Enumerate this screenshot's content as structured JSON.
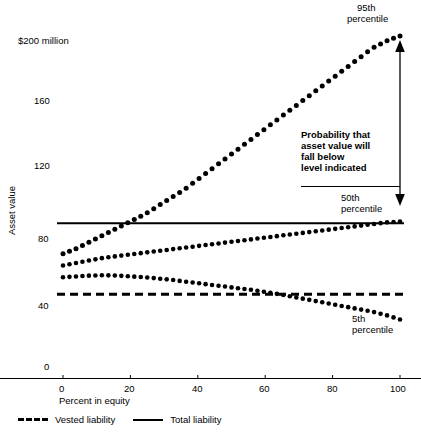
{
  "chart_data": {
    "type": "line",
    "title": "",
    "subtitle": "",
    "xlabel": "Percent in equity",
    "ylabel": "Asset value",
    "xlim": [
      0,
      100
    ],
    "ylim": [
      0,
      200
    ],
    "grid": false,
    "legend_position": "below-axis",
    "x_ticks": [
      "0",
      "20",
      "40",
      "60",
      "80",
      "100"
    ],
    "x_tick_values": [
      0,
      20,
      40,
      60,
      80,
      100
    ],
    "y_ticks": [
      "0",
      "40",
      "80",
      "120",
      "160",
      "$200 million"
    ],
    "y_tick_values": [
      0,
      40,
      80,
      120,
      160,
      200
    ],
    "y_unit_note": "$200 million",
    "x": [
      0,
      4,
      8,
      12,
      16,
      20,
      24,
      28,
      32,
      36,
      40,
      44,
      48,
      52,
      56,
      60,
      64,
      68,
      72,
      76,
      80,
      84,
      88,
      92,
      96,
      100
    ],
    "series": [
      {
        "name": "95th percentile",
        "style": "dotted",
        "values": [
          74,
          77,
          81,
          85,
          89,
          93,
          97,
          102,
          107,
          112,
          118,
          124,
          130,
          136,
          142,
          148,
          154,
          160,
          166,
          172,
          178,
          184,
          190,
          196,
          200,
          203
        ]
      },
      {
        "name": "50th percentile",
        "style": "dotted",
        "values": [
          67,
          68.5,
          70,
          71.5,
          72.5,
          73.5,
          74.5,
          75.5,
          76.5,
          77.5,
          78.5,
          79.5,
          80.5,
          81.5,
          82.5,
          83.5,
          84.5,
          85.5,
          86.5,
          87.5,
          88.5,
          89.5,
          90.5,
          91.5,
          92.5,
          93
        ]
      },
      {
        "name": "5th percentile",
        "style": "dotted",
        "values": [
          60,
          60.5,
          61,
          61.2,
          61,
          60.5,
          60,
          59.3,
          58.5,
          57.5,
          56.5,
          55.5,
          54.5,
          53.5,
          52.5,
          51.3,
          50,
          48.5,
          47,
          45.5,
          44,
          42.5,
          41,
          39.5,
          37.5,
          35
        ]
      }
    ],
    "reference_lines": [
      {
        "name": "Total liability",
        "style": "solid",
        "value": 92
      },
      {
        "name": "Vested liability",
        "style": "dashed",
        "value": 50
      }
    ],
    "annotations": [
      {
        "name": "95th-percentile-label",
        "text": "95th\npercentile"
      },
      {
        "name": "50th-percentile-label",
        "text": "50th\npercentile"
      },
      {
        "name": "5th-percentile-label",
        "text": "5th\npercentile"
      },
      {
        "name": "probability-note",
        "text": "Probability that\nasset value will\nfall below\nlevel indicated"
      }
    ],
    "colors": {
      "ink": "#000000",
      "background": "#ffffff"
    }
  },
  "labels": {
    "y_axis_title": "Asset value",
    "x_axis_title": "Percent in equity",
    "y_top": "$200 million",
    "y_160": "160",
    "y_120": "120",
    "y_80": "80",
    "y_40": "40",
    "y_0": "0",
    "x_0": "0",
    "x_20": "20",
    "x_40": "40",
    "x_60": "60",
    "x_80": "80",
    "x_100": "100",
    "p95_line1": "95th",
    "p95_line2": "percentile",
    "p50_line1": "50th",
    "p50_line2": "percentile",
    "p05_line1": "5th",
    "p05_line2": "percentile",
    "note_line1": "Probability that",
    "note_line2": "asset value will",
    "note_line3": "fall below",
    "note_line4": "level indicated"
  },
  "legend": {
    "vested_label": "Vested liability",
    "total_label": "Total liability"
  }
}
